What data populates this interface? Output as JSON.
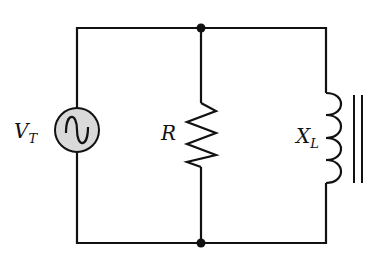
{
  "diagram": {
    "type": "parallel RL circuit",
    "components": [
      {
        "id": "source",
        "kind": "ac-voltage-source",
        "label_main": "V",
        "label_sub": "T"
      },
      {
        "id": "resistor",
        "kind": "resistor",
        "label_main": "R",
        "label_sub": ""
      },
      {
        "id": "inductor",
        "kind": "inductor-iron-core",
        "label_main": "X",
        "label_sub": "L"
      }
    ],
    "nodes": [
      "top-junction",
      "bottom-junction"
    ],
    "colors": {
      "wire": "#111111",
      "source_fill": "#d9d9d9",
      "background": "#ffffff"
    }
  }
}
